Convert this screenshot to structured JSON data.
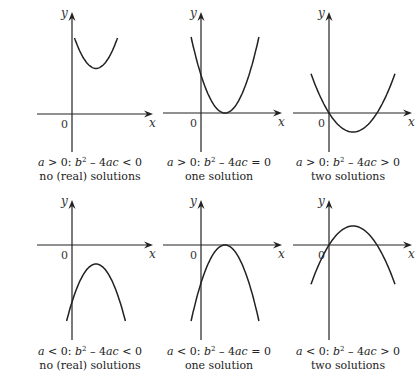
{
  "figure": {
    "axis_labels": {
      "x": "x",
      "y": "y",
      "origin": "0"
    },
    "panels": [
      {
        "id": "a-pos-disc-neg",
        "a_sign": ">",
        "disc_relation": "<",
        "condition": {
          "a": "a",
          "a_rel": " > 0: ",
          "b": "b",
          "sq": "2",
          "minus": " – 4",
          "ac": "ac",
          "rel": " < 0"
        },
        "caption": "no (real) solutions",
        "curve": {
          "opens": "up",
          "vertex": [
            1,
            1.2
          ],
          "roots": []
        }
      },
      {
        "id": "a-pos-disc-zero",
        "a_sign": ">",
        "disc_relation": "=",
        "condition": {
          "a": "a",
          "a_rel": " > 0: ",
          "b": "b",
          "sq": "2",
          "minus": " – 4",
          "ac": "ac",
          "rel": " = 0"
        },
        "caption": "one solution",
        "curve": {
          "opens": "up",
          "vertex": [
            1,
            0
          ],
          "roots": [
            1
          ]
        }
      },
      {
        "id": "a-pos-disc-pos",
        "a_sign": ">",
        "disc_relation": ">",
        "condition": {
          "a": "a",
          "a_rel": " > 0: ",
          "b": "b",
          "sq": "2",
          "minus": " – 4",
          "ac": "ac",
          "rel": " > 0"
        },
        "caption": "two solutions",
        "curve": {
          "opens": "up",
          "vertex": [
            1,
            -0.5
          ],
          "roots": [
            0,
            2
          ]
        }
      },
      {
        "id": "a-neg-disc-neg",
        "a_sign": "<",
        "disc_relation": "<",
        "condition": {
          "a": "a",
          "a_rel": " < 0: ",
          "b": "b",
          "sq": "2",
          "minus": " – 4",
          "ac": "ac",
          "rel": " < 0"
        },
        "caption": "no (real) solutions",
        "curve": {
          "opens": "down",
          "vertex": [
            1,
            -0.5
          ],
          "roots": []
        }
      },
      {
        "id": "a-neg-disc-zero",
        "a_sign": "<",
        "disc_relation": "=",
        "condition": {
          "a": "a",
          "a_rel": " < 0: ",
          "b": "b",
          "sq": "2",
          "minus": " – 4",
          "ac": "ac",
          "rel": " = 0"
        },
        "caption": "one solution",
        "curve": {
          "opens": "down",
          "vertex": [
            1,
            0
          ],
          "roots": [
            1
          ]
        }
      },
      {
        "id": "a-neg-disc-pos",
        "a_sign": "<",
        "disc_relation": ">",
        "condition": {
          "a": "a",
          "a_rel": " < 0: ",
          "b": "b",
          "sq": "2",
          "minus": " – 4",
          "ac": "ac",
          "rel": " > 0"
        },
        "caption": "two solutions",
        "curve": {
          "opens": "down",
          "vertex": [
            1,
            0.5
          ],
          "roots": [
            0,
            2
          ]
        }
      }
    ]
  }
}
